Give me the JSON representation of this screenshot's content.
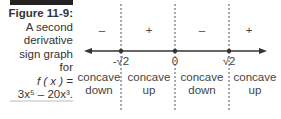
{
  "caption": {
    "figure_label": "Figure 11-9:",
    "line1": "A second",
    "line2": "derivative",
    "line3": "sign graph",
    "line4": "for",
    "line5": "f ( x ) =",
    "line6": "3x⁵ – 20x³."
  },
  "number_line": {
    "points": [
      "-√2",
      "0",
      "√2"
    ],
    "signs": [
      "–",
      "+",
      "–",
      "+"
    ],
    "regions": [
      {
        "line1": "concave",
        "line2": "down"
      },
      {
        "line1": "concave",
        "line2": "up"
      },
      {
        "line1": "concave",
        "line2": "down"
      },
      {
        "line1": "concave",
        "line2": "up"
      }
    ]
  }
}
